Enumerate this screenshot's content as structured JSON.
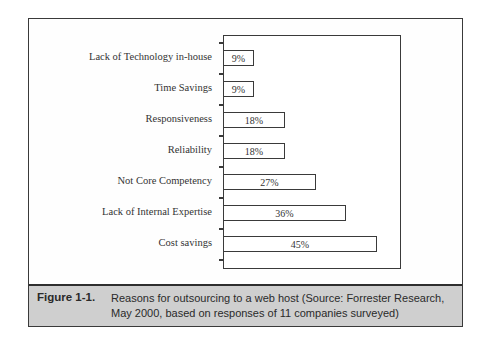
{
  "chart_data": {
    "type": "bar",
    "orientation": "horizontal",
    "categories": [
      "Lack of Technology in-house",
      "Time Savings",
      "Responsiveness",
      "Reliability",
      "Not Core Competency",
      "Lack of Internal Expertise",
      "Cost savings"
    ],
    "values": [
      9,
      9,
      18,
      18,
      27,
      36,
      45
    ],
    "value_labels": [
      "9%",
      "9%",
      "18%",
      "18%",
      "27%",
      "36%",
      "45%"
    ],
    "title": "",
    "xlabel": "",
    "ylabel": "",
    "xlim": [
      0,
      52
    ],
    "grid": false,
    "legend": null
  },
  "caption": {
    "figure_number": "Figure 1-1.",
    "text": "Reasons for outsourcing to a web host (Source: Forrester Research, May 2000, based on responses of 11 companies surveyed)"
  },
  "colors": {
    "caption_background": "#cfcfcf",
    "border": "#3a3a3a",
    "bar_fill": "#ffffff"
  }
}
